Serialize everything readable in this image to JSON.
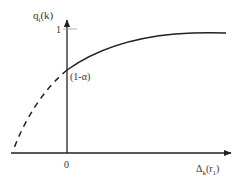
{
  "diagram": {
    "y_axis_label_main": "q",
    "y_axis_label_sub": "i",
    "y_axis_label_arg": "(k)",
    "x_axis_label_main": "Δ",
    "x_axis_label_sub": "k",
    "x_axis_label_arg_open": "(r",
    "x_axis_label_arg_sub": "1",
    "x_axis_label_arg_close": ")",
    "y_tick_label": "1",
    "intercept_label": "(1-α)",
    "origin_label": "0",
    "colors": {
      "axis": "#222222",
      "curve": "#222222",
      "text": "#333333"
    }
  }
}
